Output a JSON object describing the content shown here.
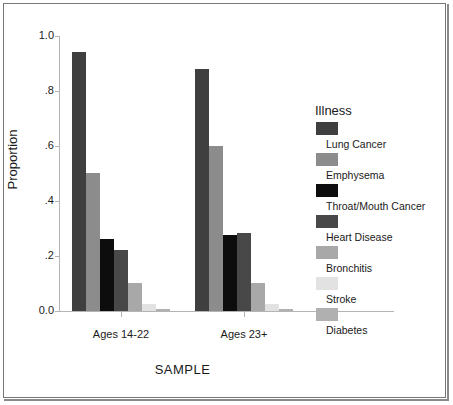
{
  "chart_data": {
    "type": "bar",
    "title": "",
    "subtitle": "",
    "xlabel": "SAMPLE",
    "ylabel": "Proportion",
    "categories": [
      "Ages 14-22",
      "Ages 23+"
    ],
    "ylim": [
      0.0,
      1.0
    ],
    "ytick_labels": [
      "1.0",
      ".8",
      ".6",
      ".4",
      ".2",
      "0.0"
    ],
    "ytick_values": [
      1.0,
      0.8,
      0.6,
      0.4,
      0.2,
      0.0
    ],
    "grid": false,
    "legend_position": "right",
    "legend_title": "Illness",
    "series": [
      {
        "name": "Lung Cancer",
        "color": "#3f3f3f",
        "values": [
          0.94,
          0.88
        ]
      },
      {
        "name": "Emphysema",
        "color": "#8c8c8c",
        "values": [
          0.5,
          0.6
        ]
      },
      {
        "name": "Throat/Mouth Cancer",
        "color": "#0d0d0d",
        "values": [
          0.26,
          0.275
        ]
      },
      {
        "name": "Heart Disease",
        "color": "#484848",
        "values": [
          0.22,
          0.285
        ]
      },
      {
        "name": "Bronchitis",
        "color": "#a8a8a8",
        "values": [
          0.1,
          0.1
        ]
      },
      {
        "name": "Stroke",
        "color": "#e2e2e2",
        "values": [
          0.025,
          0.025
        ]
      },
      {
        "name": "Diabetes",
        "color": "#b0b0b0",
        "values": [
          0.008,
          0.008
        ]
      }
    ]
  }
}
